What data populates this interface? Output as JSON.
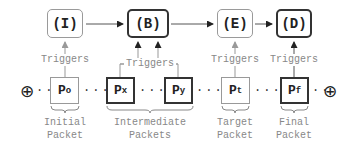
{
  "states": [
    {
      "id": "I",
      "label": "(I)",
      "style": "light"
    },
    {
      "id": "B",
      "label": "(B)",
      "style": "dark"
    },
    {
      "id": "E",
      "label": "(E)",
      "style": "light"
    },
    {
      "id": "D",
      "label": "(D)",
      "style": "dark"
    }
  ],
  "packets": [
    {
      "id": "Po",
      "base": "P",
      "sub": "o",
      "style": "light"
    },
    {
      "id": "Px",
      "base": "P",
      "sub": "x",
      "style": "dark"
    },
    {
      "id": "Py",
      "base": "P",
      "sub": "y",
      "style": "dark"
    },
    {
      "id": "Pt",
      "base": "P",
      "sub": "t",
      "style": "light"
    },
    {
      "id": "Pf",
      "base": "P",
      "sub": "f",
      "style": "dark"
    }
  ],
  "trigger_label": "Triggers",
  "triggers": [
    "Triggers",
    "Triggers",
    "Triggers",
    "Triggers"
  ],
  "dots": "...",
  "endpoint_symbol": "⊕",
  "groups": [
    {
      "line1": "Initial",
      "line2": "Packet"
    },
    {
      "line1": "Intermediate",
      "line2": "Packets"
    },
    {
      "line1": "Target",
      "line2": "Packet"
    },
    {
      "line1": "Final",
      "line2": "Packet"
    }
  ]
}
